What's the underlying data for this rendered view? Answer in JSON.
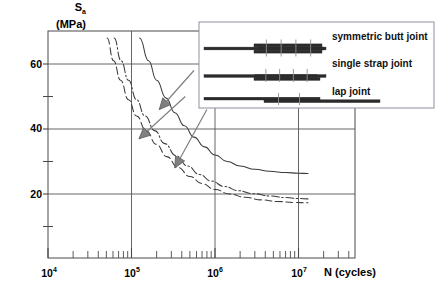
{
  "chart_data": {
    "type": "line",
    "title": "",
    "xlabel": "N (cycles)",
    "ylabel": "S_a (MPa)",
    "y_axis_label_main": "S",
    "y_axis_label_sub": "a",
    "y_axis_label_units": "(MPa)",
    "x_scale": "log10",
    "xlim": [
      10000,
      20000000
    ],
    "ylim": [
      8,
      75
    ],
    "y_major_ticks": [
      20,
      40,
      60
    ],
    "y_minor_ticks": [
      10,
      30,
      50
    ],
    "y_tick_labels": [
      "20",
      "40",
      "60"
    ],
    "x_major_ticks": [
      10000,
      100000,
      1000000,
      10000000
    ],
    "x_tick_labels": [
      "10⁴",
      "10⁵",
      "10⁶",
      "10⁷"
    ],
    "x_tick_label_bases": [
      "10",
      "10",
      "10",
      "10"
    ],
    "x_tick_label_exponents": [
      "4",
      "5",
      "6",
      "7"
    ],
    "grid": true,
    "legend_position": "inside-top-right",
    "series": [
      {
        "name": "symmetric butt joint",
        "style": "solid",
        "points": [
          [
            100000,
            75
          ],
          [
            125000,
            68
          ],
          [
            160000,
            61
          ],
          [
            200000,
            55
          ],
          [
            260000,
            49.5
          ],
          [
            330000,
            45
          ],
          [
            430000,
            41
          ],
          [
            560000,
            37.5
          ],
          [
            750000,
            34.5
          ],
          [
            1000000,
            32
          ],
          [
            1400000,
            30
          ],
          [
            2000000,
            28.6
          ],
          [
            3000000,
            27.6
          ],
          [
            4500000,
            27.0
          ],
          [
            7000000,
            26.6
          ],
          [
            10000000,
            26.4
          ],
          [
            13000000,
            26.3
          ]
        ]
      },
      {
        "name": "single strap joint",
        "style": "dash-dot",
        "points": [
          [
            52000,
            75
          ],
          [
            62000,
            68
          ],
          [
            75000,
            61
          ],
          [
            92000,
            55
          ],
          [
            115000,
            49
          ],
          [
            145000,
            44
          ],
          [
            190000,
            39.5
          ],
          [
            250000,
            35.5
          ],
          [
            340000,
            31.8
          ],
          [
            470000,
            28.6
          ],
          [
            650000,
            26.0
          ],
          [
            900000,
            24.0
          ],
          [
            1300000,
            22.3
          ],
          [
            1900000,
            21.0
          ],
          [
            2900000,
            20.1
          ],
          [
            4500000,
            19.4
          ],
          [
            7000000,
            18.9
          ],
          [
            10000000,
            18.6
          ],
          [
            13000000,
            18.5
          ]
        ]
      },
      {
        "name": "lap joint",
        "style": "dashed",
        "points": [
          [
            43000,
            75
          ],
          [
            51000,
            68
          ],
          [
            61000,
            61
          ],
          [
            74000,
            55
          ],
          [
            92000,
            49
          ],
          [
            115000,
            44
          ],
          [
            150000,
            39.5
          ],
          [
            198000,
            35.3
          ],
          [
            265000,
            31.5
          ],
          [
            360000,
            28.2
          ],
          [
            500000,
            25.4
          ],
          [
            700000,
            23.2
          ],
          [
            1000000,
            21.4
          ],
          [
            1500000,
            20.0
          ],
          [
            2300000,
            19.0
          ],
          [
            3600000,
            18.2
          ],
          [
            5600000,
            17.7
          ],
          [
            9000000,
            17.4
          ],
          [
            13000000,
            17.3
          ]
        ]
      }
    ],
    "annotations": [
      {
        "label": "arrow to symmetric butt joint curve",
        "from": [
          560000,
          58
        ],
        "to": [
          215000,
          46
        ]
      },
      {
        "label": "arrow to single strap joint curve",
        "from": [
          440000,
          50
        ],
        "to": [
          123000,
          37
        ]
      },
      {
        "label": "arrow to lap joint curve",
        "from": [
          800000,
          46
        ],
        "to": [
          330000,
          28
        ]
      }
    ]
  },
  "legend": {
    "items": [
      {
        "label": "symmetric butt joint",
        "diagram": "symmetric-butt-joint-diagram"
      },
      {
        "label": "single strap joint",
        "diagram": "single-strap-joint-diagram"
      },
      {
        "label": "lap joint",
        "diagram": "lap-joint-diagram"
      }
    ]
  },
  "colors": {
    "axis": "#4a4a4a",
    "grid": "#555555",
    "curve": "#3a3a3a",
    "arrow": "#808080",
    "legend_border": "#8f8f9f",
    "plate": "#2b2b2b",
    "text": "#000000"
  }
}
